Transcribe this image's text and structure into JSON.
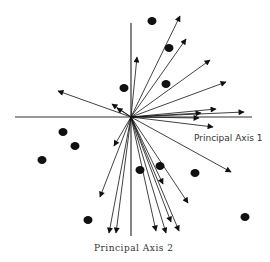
{
  "diagram": {
    "title": "",
    "origin": [
      131,
      117
    ],
    "colors": {
      "line": "#333333",
      "arrow": "#111111",
      "dot": "#111111",
      "background": "#ffffff"
    },
    "axes": {
      "horizontal": {
        "x1": 15,
        "y1": 117,
        "x2": 252,
        "y2": 117,
        "label": "Principal Axis 1",
        "label_pos": [
          194,
          141
        ]
      },
      "vertical": {
        "x1": 131,
        "y1": 23,
        "x2": 131,
        "y2": 236,
        "label": "Principal Axis 2",
        "label_pos": [
          94,
          251
        ]
      }
    },
    "arrows": [
      {
        "to": [
          137,
          57
        ]
      },
      {
        "to": [
          180,
          16
        ]
      },
      {
        "to": [
          186,
          39
        ]
      },
      {
        "to": [
          210,
          60
        ]
      },
      {
        "to": [
          226,
          82
        ]
      },
      {
        "to": [
          216,
          109
        ]
      },
      {
        "to": [
          244,
          112
        ]
      },
      {
        "to": [
          201,
          113
        ]
      },
      {
        "to": [
          199,
          118
        ]
      },
      {
        "to": [
          213,
          127
        ]
      },
      {
        "to": [
          231,
          172
        ]
      },
      {
        "to": [
          58,
          91
        ]
      },
      {
        "to": [
          112,
          104
        ]
      },
      {
        "to": [
          117,
          108
        ]
      },
      {
        "to": [
          114,
          146
        ]
      },
      {
        "to": [
          100,
          197
        ]
      },
      {
        "to": [
          109,
          233
        ]
      },
      {
        "to": [
          116,
          233
        ]
      },
      {
        "to": [
          156,
          231
        ]
      },
      {
        "to": [
          166,
          233
        ]
      },
      {
        "to": [
          171,
          222
        ]
      },
      {
        "to": [
          179,
          231
        ]
      },
      {
        "to": [
          163,
          184
        ]
      },
      {
        "to": [
          188,
          203
        ]
      }
    ],
    "points": [
      [
        152,
        21
      ],
      [
        124,
        88
      ],
      [
        169,
        48
      ],
      [
        166,
        84
      ],
      [
        63,
        132
      ],
      [
        75,
        146
      ],
      [
        42,
        160
      ],
      [
        88,
        220
      ],
      [
        140,
        170
      ],
      [
        160,
        166
      ],
      [
        195,
        173
      ],
      [
        245,
        217
      ]
    ]
  }
}
